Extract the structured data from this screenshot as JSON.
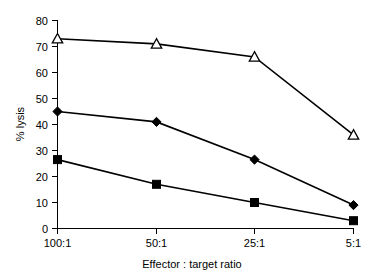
{
  "chart_data": {
    "type": "line",
    "title": "",
    "xlabel": "Effector : target ratio",
    "ylabel": "% lysis",
    "categories": [
      "100:1",
      "50:1",
      "25:1",
      "5:1"
    ],
    "xtick_labels": [
      "100:1",
      "50:1",
      "25:1",
      "5:1"
    ],
    "ytick_labels": [
      "0",
      "10",
      "20",
      "30",
      "40",
      "50",
      "60",
      "70",
      "80"
    ],
    "yticks": [
      0,
      10,
      20,
      30,
      40,
      50,
      60,
      70,
      80
    ],
    "ylim": [
      0,
      80
    ],
    "grid": false,
    "legend": "none",
    "series": [
      {
        "name": "open-triangle-series",
        "marker": "triangle-open",
        "values": [
          73,
          71,
          66,
          36
        ]
      },
      {
        "name": "filled-diamond-series",
        "marker": "diamond-filled",
        "values": [
          45,
          41,
          26.5,
          9
        ]
      },
      {
        "name": "filled-square-series",
        "marker": "square-filled",
        "values": [
          26.5,
          17,
          10,
          3
        ]
      }
    ]
  },
  "axes": {
    "y_label_text": "% lysis",
    "x_label_text": "Effector : target ratio"
  },
  "colors": {
    "ink": "#000000",
    "background": "#ffffff",
    "marker_fill_open": "#ffffff"
  }
}
